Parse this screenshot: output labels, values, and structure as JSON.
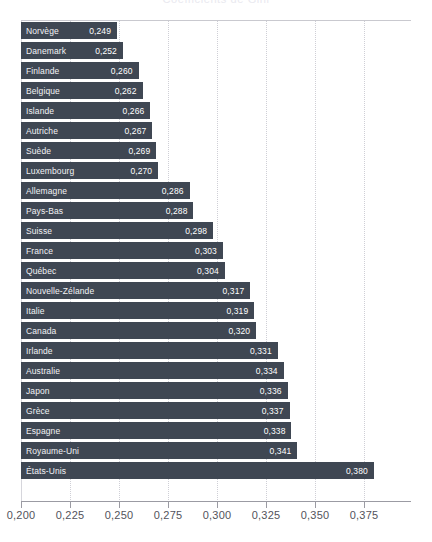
{
  "chart_data": {
    "type": "bar",
    "orientation": "horizontal",
    "title": "Coefficients de Gini",
    "xlabel": "",
    "ylabel": "",
    "xlim": [
      0.2,
      0.38
    ],
    "xticks": [
      "0,200",
      "0,225",
      "0,250",
      "0,275",
      "0,300",
      "0,325",
      "0,350",
      "0,375"
    ],
    "xtick_values": [
      0.2,
      0.225,
      0.25,
      0.275,
      0.3,
      0.325,
      0.35,
      0.375
    ],
    "grid": "vertical-dotted",
    "legend": null,
    "bar_color": "#3f4753",
    "label_color": "#f2f2f5",
    "categories": [
      "Norvège",
      "Danemark",
      "Finlande",
      "Belgique",
      "Islande",
      "Autriche",
      "Suède",
      "Luxembourg",
      "Allemagne",
      "Pays-Bas",
      "Suisse",
      "France",
      "Québec",
      "Nouvelle-Zélande",
      "Italie",
      "Canada",
      "Irlande",
      "Australie",
      "Japon",
      "Grèce",
      "Espagne",
      "Royaume-Uni",
      "États-Unis"
    ],
    "values": [
      0.249,
      0.252,
      0.26,
      0.262,
      0.266,
      0.267,
      0.269,
      0.27,
      0.286,
      0.288,
      0.298,
      0.303,
      0.304,
      0.317,
      0.319,
      0.32,
      0.331,
      0.334,
      0.336,
      0.337,
      0.338,
      0.341,
      0.38
    ],
    "value_labels": [
      "0,249",
      "0,252",
      "0,260",
      "0,262",
      "0,266",
      "0,267",
      "0,269",
      "0,270",
      "0,286",
      "0,288",
      "0,298",
      "0,303",
      "0,304",
      "0,317",
      "0,319",
      "0,320",
      "0,331",
      "0,334",
      "0,336",
      "0,337",
      "0,338",
      "0,341",
      "0,380"
    ]
  }
}
